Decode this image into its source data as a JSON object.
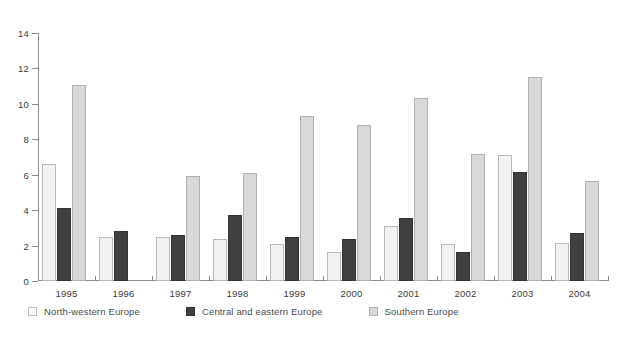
{
  "chart_data": {
    "type": "bar",
    "title": "",
    "subtitle": "",
    "xlabel": "",
    "ylabel": "",
    "categories": [
      "1995",
      "1996",
      "1997",
      "1998",
      "1999",
      "2000",
      "2001",
      "2002",
      "2003",
      "2004"
    ],
    "series": [
      {
        "name": "North-western Europe",
        "color": "#f2f2f2",
        "values": [
          6.6,
          2.5,
          2.5,
          2.4,
          2.1,
          1.65,
          3.1,
          2.1,
          7.1,
          2.15
        ]
      },
      {
        "name": "Central and eastern Europe",
        "color": "#404040",
        "values": [
          4.15,
          2.85,
          2.6,
          3.75,
          2.5,
          2.4,
          3.55,
          1.65,
          6.15,
          2.7
        ]
      },
      {
        "name": "Southern Europe",
        "color": "#d9d9d9",
        "values": [
          11.05,
          null,
          5.95,
          6.1,
          9.3,
          8.8,
          10.35,
          7.15,
          11.5,
          5.65
        ]
      }
    ],
    "ylim": [
      0,
      14
    ],
    "yticks": [
      0,
      2,
      4,
      6,
      8,
      10,
      12,
      14
    ],
    "ytick_labels": [
      "0",
      "2",
      "4",
      "6",
      "8",
      "10",
      "12",
      "14"
    ],
    "grid": false,
    "legend_position": "bottom-left"
  },
  "legend": {
    "items": [
      {
        "label": "North-western Europe",
        "swatch": "s-nw"
      },
      {
        "label": "Central and eastern Europe",
        "swatch": "s-ce"
      },
      {
        "label": "Southern Europe",
        "swatch": "s-se"
      }
    ]
  }
}
